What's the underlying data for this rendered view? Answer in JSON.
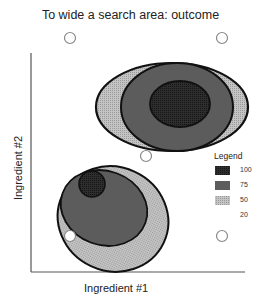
{
  "title": "To wide a search area: outcome",
  "axes": {
    "x_label": "Ingredient #1",
    "y_label": "Ingredient #2"
  },
  "legend": {
    "title": "Legend",
    "entries": [
      {
        "label": "100",
        "color": "#2a2a2a",
        "pattern": "dense-dark"
      },
      {
        "label": "75",
        "color": "#5a5a5a",
        "pattern": "dark-gray"
      },
      {
        "label": "50",
        "color": "#b8b8b8",
        "pattern": "light-dotted"
      },
      {
        "label": "20",
        "color": "#ffffff",
        "pattern": "none"
      }
    ]
  },
  "colors": {
    "level_100": "#2a2a2a",
    "level_75": "#5c5c5c",
    "level_50": "#b5b5b5",
    "outline": "#111111",
    "sample_point": "#888888"
  },
  "sample_points": [
    {
      "name": "top-left",
      "cx": 70,
      "cy": 38
    },
    {
      "name": "top-right",
      "cx": 222,
      "cy": 38
    },
    {
      "name": "center",
      "cx": 146,
      "cy": 156
    },
    {
      "name": "bottom-left",
      "cx": 70,
      "cy": 236
    },
    {
      "name": "bottom-right",
      "cx": 222,
      "cy": 236
    }
  ]
}
